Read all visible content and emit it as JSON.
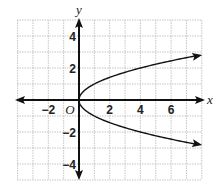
{
  "chart_data": {
    "type": "line",
    "title": "",
    "xlabel": "x",
    "ylabel": "y",
    "origin_label": "O",
    "x_ticks": [
      -2,
      2,
      4,
      6
    ],
    "y_ticks": [
      4,
      2,
      -2,
      -4
    ],
    "x_tick_labels": [
      "−2",
      "2",
      "4",
      "6"
    ],
    "y_tick_labels": [
      "4",
      "2",
      "−2",
      "−4"
    ],
    "xlim": [
      -4,
      8
    ],
    "ylim": [
      -5,
      5
    ],
    "grid": true,
    "series": [
      {
        "name": "x = y^2",
        "equation": "x = y^2",
        "points": [
          [
            0,
            0
          ],
          [
            0.25,
            0.5
          ],
          [
            1,
            1
          ],
          [
            2.25,
            1.5
          ],
          [
            4,
            2
          ],
          [
            6.25,
            2.5
          ],
          [
            7.9,
            2.81
          ]
        ],
        "points_lower": [
          [
            0,
            0
          ],
          [
            0.25,
            -0.5
          ],
          [
            1,
            -1
          ],
          [
            2.25,
            -1.5
          ],
          [
            4,
            -2
          ],
          [
            6.25,
            -2.5
          ],
          [
            7.9,
            -2.81
          ]
        ],
        "arrows": true
      }
    ]
  }
}
